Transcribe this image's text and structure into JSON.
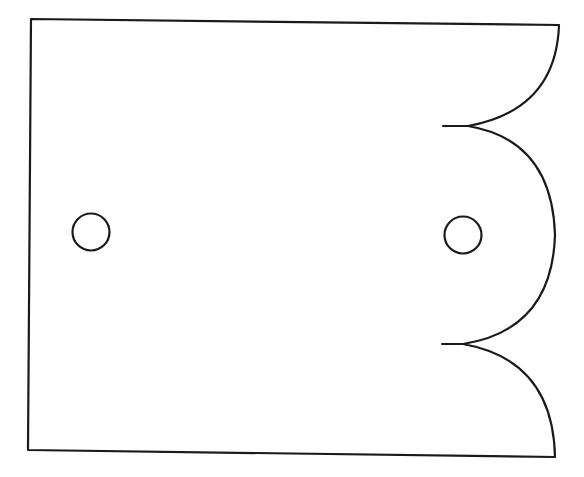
{
  "diagram": {
    "type": "line-drawing",
    "colors": {
      "stroke": "#1a1a1a",
      "background": "#ffffff"
    },
    "plate": {
      "top_left": [
        31,
        19
      ],
      "top_right": [
        559,
        25
      ],
      "bottom_left": [
        28,
        450
      ],
      "bottom_right": [
        555,
        457
      ]
    },
    "cusps": [
      {
        "tip": [
          443,
          126
        ],
        "join": [
          468,
          126
        ]
      },
      {
        "tip": [
          442,
          344
        ],
        "join": [
          463,
          344
        ]
      }
    ],
    "holes": [
      {
        "name": "left-hole",
        "cx": 91,
        "cy": 232,
        "r": 18.5
      },
      {
        "name": "right-hole",
        "cx": 463,
        "cy": 235,
        "r": 18.5
      }
    ]
  }
}
